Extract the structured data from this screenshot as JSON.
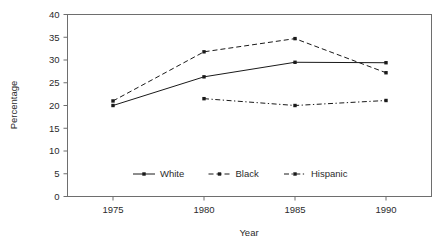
{
  "chart_data": {
    "type": "line",
    "title": "",
    "xlabel": "Year",
    "ylabel": "Percentage",
    "x": [
      1975,
      1980,
      1985,
      1990
    ],
    "categories": [
      "1975",
      "1980",
      "1985",
      "1990"
    ],
    "xlim": [
      1972.5,
      1992.5
    ],
    "ylim": [
      0,
      40
    ],
    "yticks": [
      0,
      5,
      10,
      15,
      20,
      25,
      30,
      35,
      40
    ],
    "ytick_labels": [
      "0",
      "5",
      "10",
      "15",
      "20",
      "25",
      "30",
      "35",
      "40"
    ],
    "xticks": [
      1975,
      1980,
      1985,
      1990
    ],
    "xtick_labels": [
      "1975",
      "1980",
      "1985",
      "1990"
    ],
    "grid": false,
    "legend_position": "inside-bottom-center",
    "series": [
      {
        "name": "White",
        "style": "solid",
        "marker": "square",
        "color": "#1a1a1a",
        "x": [
          1975,
          1980,
          1985,
          1990
        ],
        "values": [
          20.0,
          26.3,
          29.5,
          29.4
        ]
      },
      {
        "name": "Black",
        "style": "dashed",
        "marker": "square",
        "color": "#1a1a1a",
        "x": [
          1975,
          1980,
          1985,
          1990
        ],
        "values": [
          21.0,
          31.8,
          34.7,
          27.2
        ]
      },
      {
        "name": "Hispanic",
        "style": "dash-dot",
        "marker": "square",
        "color": "#1a1a1a",
        "x": [
          1980,
          1985,
          1990
        ],
        "values": [
          21.5,
          20.0,
          21.1
        ]
      }
    ]
  },
  "legend": {
    "items": [
      {
        "label": "White"
      },
      {
        "label": "Black"
      },
      {
        "label": "Hispanic"
      }
    ]
  },
  "axes": {
    "y_title": "Percentage",
    "x_title": "Year"
  },
  "colors": {
    "ink": "#1a1a1a",
    "frame": "#6e6e6e",
    "background": "#ffffff"
  }
}
